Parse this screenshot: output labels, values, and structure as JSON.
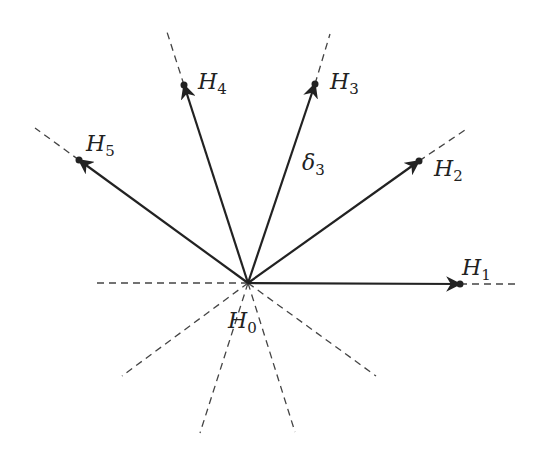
{
  "diagram": {
    "center": {
      "name": "H",
      "sub": "0",
      "x": 248,
      "y": 283
    },
    "points": [
      {
        "name": "H",
        "sub": "1",
        "x": 460,
        "y": 284,
        "dash_end": [
          516,
          284
        ],
        "label_x": 462,
        "label_y": 275
      },
      {
        "name": "H",
        "sub": "2",
        "x": 419,
        "y": 161,
        "dash_end": [
          465,
          130
        ],
        "label_x": 434,
        "label_y": 176
      },
      {
        "name": "H",
        "sub": "3",
        "x": 315,
        "y": 84,
        "dash_end": [
          330,
          34
        ],
        "label_x": 330,
        "label_y": 89
      },
      {
        "name": "H",
        "sub": "4",
        "x": 184,
        "y": 85,
        "dash_end": [
          167,
          32
        ],
        "label_x": 198,
        "label_y": 89
      },
      {
        "name": "H",
        "sub": "5",
        "x": 79,
        "y": 160,
        "dash_end": [
          35,
          128
        ],
        "label_x": 86,
        "label_y": 151
      }
    ],
    "extra_dashes": [
      [
        93,
        283
      ],
      [
        122,
        376
      ],
      [
        200,
        433
      ],
      [
        295,
        432
      ],
      [
        376,
        376
      ]
    ],
    "delta_label": {
      "name": "δ",
      "sub": "3",
      "x": 302,
      "y": 170
    },
    "center_label": {
      "x": 228,
      "y": 328
    }
  }
}
